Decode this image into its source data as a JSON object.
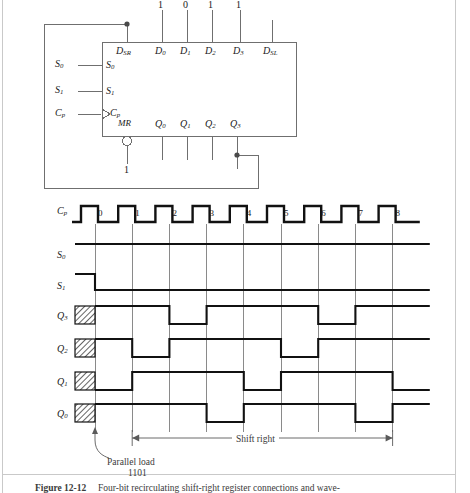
{
  "figure": {
    "caption_label": "Figure 12-12",
    "caption_text": "Four-bit recirculating shift-right register connections and wave-"
  },
  "circuit": {
    "data_inputs_values": [
      "1",
      "0",
      "1",
      "1"
    ],
    "top_pin_labels": [
      "D_SR",
      "D_0",
      "D_1",
      "D_2",
      "D_3",
      "D_SL"
    ],
    "top_pins": [
      {
        "name": "DSR",
        "main": "D",
        "sub": "SR"
      },
      {
        "name": "D0",
        "main": "D",
        "sub": "0"
      },
      {
        "name": "D1",
        "main": "D",
        "sub": "1"
      },
      {
        "name": "D2",
        "main": "D",
        "sub": "2"
      },
      {
        "name": "D3",
        "main": "D",
        "sub": "3"
      },
      {
        "name": "DSL",
        "main": "D",
        "sub": "SL"
      }
    ],
    "left_pins": [
      {
        "name": "S0",
        "main": "S",
        "sub": "0"
      },
      {
        "name": "S1",
        "main": "S",
        "sub": "1"
      },
      {
        "name": "Cp",
        "main": "C",
        "sub": "p"
      }
    ],
    "left_external_labels": [
      {
        "main": "S",
        "sub": "0"
      },
      {
        "main": "S",
        "sub": "1"
      },
      {
        "main": "C",
        "sub": "p"
      }
    ],
    "mr_label": "MR",
    "mr_value": "1",
    "bottom_pins": [
      {
        "name": "Q0",
        "main": "Q",
        "sub": "0"
      },
      {
        "name": "Q1",
        "main": "Q",
        "sub": "1"
      },
      {
        "name": "Q2",
        "main": "Q",
        "sub": "2"
      },
      {
        "name": "Q3",
        "main": "Q",
        "sub": "3"
      }
    ]
  },
  "timing": {
    "clock_row_label": {
      "main": "C",
      "sub": "p"
    },
    "clock_pulse_numbers": [
      "0",
      "1",
      "2",
      "3",
      "4",
      "5",
      "6",
      "7",
      "8"
    ],
    "rows": [
      {
        "main": "S",
        "sub": "0"
      },
      {
        "main": "S",
        "sub": "1"
      },
      {
        "main": "Q",
        "sub": "3"
      },
      {
        "main": "Q",
        "sub": "2"
      },
      {
        "main": "Q",
        "sub": "1"
      },
      {
        "main": "Q",
        "sub": "0"
      }
    ],
    "annotations": {
      "parallel_load": "Parallel load",
      "parallel_load_value": "1101",
      "shift_right": "Shift right"
    },
    "waveform_levels": {
      "S0": [
        1,
        1,
        1,
        1,
        1,
        1,
        1,
        1,
        1,
        1
      ],
      "S1_before_t0": 1,
      "S1": [
        0,
        0,
        0,
        0,
        0,
        0,
        0,
        0,
        0,
        0
      ],
      "Q3": [
        1,
        1,
        0,
        1,
        1,
        1,
        0,
        1,
        1,
        1
      ],
      "Q2": [
        1,
        0,
        1,
        1,
        1,
        0,
        1,
        1,
        1,
        1
      ],
      "Q1": [
        0,
        1,
        1,
        1,
        0,
        1,
        1,
        1,
        0,
        0
      ],
      "Q0": [
        1,
        1,
        1,
        0,
        1,
        1,
        1,
        0,
        1,
        1
      ]
    }
  },
  "colors": {
    "ink": "#111111",
    "thin": "#6f6f6f",
    "page_rule": "#c9c9c9"
  }
}
